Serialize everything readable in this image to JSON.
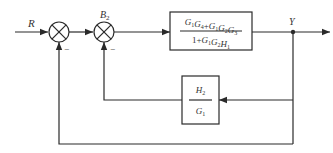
{
  "diagram": {
    "type": "control-system-block-diagram",
    "input_label": "R",
    "output_label": "Y",
    "junctions": [
      {
        "id": "sum1",
        "label": "",
        "feedback_sign": "−"
      },
      {
        "id": "sum2",
        "label": "B",
        "label_sub": "2",
        "feedback_sign": "−"
      }
    ],
    "forward_block": {
      "numerator": [
        {
          "t": "G",
          "s": "1"
        },
        {
          "t": "G",
          "s": "4"
        },
        {
          "t": "+",
          "s": ""
        },
        {
          "t": "G",
          "s": "1"
        },
        {
          "t": "G",
          "s": "2"
        },
        {
          "t": "G",
          "s": "3"
        }
      ],
      "denominator": [
        {
          "t": "1+",
          "s": ""
        },
        {
          "t": "G",
          "s": "1"
        },
        {
          "t": "G",
          "s": "2"
        },
        {
          "t": "H",
          "s": "1"
        }
      ],
      "numerator_text": "G1G4+G1G2G3",
      "denominator_text": "1+G1G2H1"
    },
    "feedback_block": {
      "numerator": [
        {
          "t": "H",
          "s": "2"
        }
      ],
      "denominator": [
        {
          "t": "G",
          "s": "1"
        }
      ],
      "numerator_text": "H2",
      "denominator_text": "G1"
    },
    "colors": {
      "line": "#2a2a2a",
      "text": "#333333",
      "background": "#ffffff"
    }
  }
}
